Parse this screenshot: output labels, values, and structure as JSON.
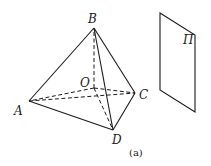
{
  "diagram": {
    "labels": {
      "A": "A",
      "B": "B",
      "C": "C",
      "D": "D",
      "O": "O",
      "plane": "Π"
    },
    "caption": "(a)",
    "points": {
      "A": [
        29,
        101
      ],
      "B": [
        94,
        28
      ],
      "C": [
        135,
        93
      ],
      "D": [
        113,
        130
      ],
      "O": [
        94,
        88
      ]
    },
    "edges_solid": [
      "AB",
      "BC",
      "BD",
      "AD",
      "CD"
    ],
    "edges_dashed": [
      "AC",
      "OB",
      "OA",
      "OC",
      "OD"
    ],
    "plane_vertices": [
      [
        160,
        13
      ],
      [
        195,
        35
      ],
      [
        195,
        112
      ],
      [
        160,
        90
      ]
    ]
  }
}
